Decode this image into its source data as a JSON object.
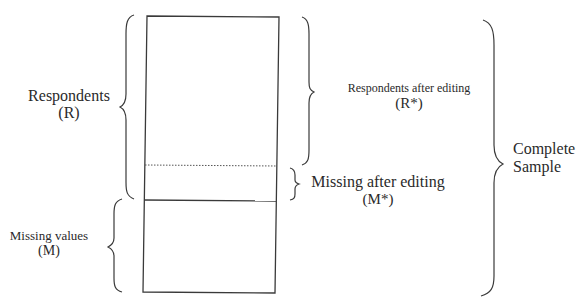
{
  "diagram": {
    "type": "sample-partition",
    "colors": {
      "stroke": "#3a3a3a",
      "text": "#2a2a2a",
      "background": "#ffffff"
    },
    "rectangle": {
      "segments": [
        {
          "id": "respondents-after-editing",
          "style": "region"
        },
        {
          "id": "missing-after-editing",
          "style": "region",
          "top_divider": "dotted"
        },
        {
          "id": "missing-values",
          "style": "region",
          "top_divider": "solid"
        }
      ]
    },
    "labels": {
      "respondents": {
        "line1": "Respondents",
        "line2": "(R)"
      },
      "missing_values": {
        "line1": "Missing values",
        "line2": "(M)"
      },
      "respondents_after_editing": {
        "line1": "Respondents after editing",
        "line2": "(R*)"
      },
      "missing_after_editing": {
        "line1": "Missing after editing",
        "line2": "(M*)"
      },
      "complete_sample": {
        "line1": "Complete",
        "line2": "Sample"
      }
    },
    "braces": [
      {
        "id": "respondents-brace",
        "side": "left",
        "spans": "R"
      },
      {
        "id": "missing-values-brace",
        "side": "left",
        "spans": "M"
      },
      {
        "id": "respondents-after-editing-brace",
        "side": "right",
        "spans": "R*"
      },
      {
        "id": "missing-after-editing-brace",
        "side": "right",
        "spans": "M*"
      },
      {
        "id": "complete-sample-brace",
        "side": "right",
        "spans": "Complete Sample"
      }
    ]
  }
}
